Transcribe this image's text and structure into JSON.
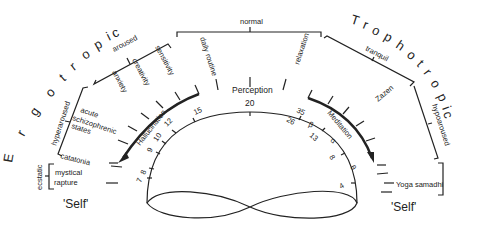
{
  "title_left": "Ergotropic",
  "title_right": "Trophotropic",
  "self_left": "'Self'",
  "self_right": "'Self'",
  "top_bracket": {
    "label": "normal",
    "items": [
      "daily routine",
      "relaxation"
    ]
  },
  "left_brackets": {
    "aroused": {
      "label": "aroused",
      "items": [
        "anxiety",
        "creativity",
        "sensitivity"
      ]
    },
    "hyperaroused": {
      "label": "hyperaroused",
      "items": [
        "acute schizophrenic states",
        "catatonia"
      ]
    },
    "ecstatic": {
      "label": "ecstatic",
      "items": [
        "mystical",
        "rapture"
      ]
    }
  },
  "right_brackets": {
    "tranquil": {
      "label": "tranquil",
      "items": [
        "Zazen"
      ]
    },
    "hypoaroused": {
      "label": "hypoaroused",
      "items": []
    },
    "samadhi": {
      "label": "",
      "items": [
        "Yoga samadhi"
      ]
    }
  },
  "center": {
    "label": "Perception",
    "arc_left": "Hallucination",
    "arc_right": "Meditation",
    "inner_numbers_left": [
      "7",
      "8",
      "9",
      "10",
      "12",
      "15"
    ],
    "inner_top": "20",
    "inner_numbers_right_outer": [
      "35",
      "β",
      "α",
      "θ"
    ],
    "inner_numbers_right_inner": [
      "26",
      "13",
      "8",
      "4"
    ]
  }
}
